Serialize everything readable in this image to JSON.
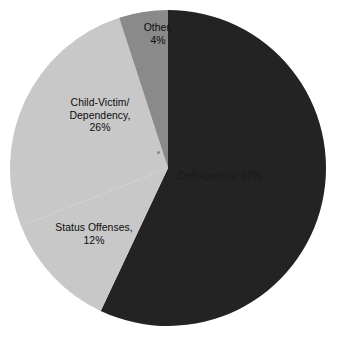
{
  "chart_data": {
    "type": "pie",
    "title": "",
    "categories": [
      "Delinquency",
      "Child-Victim/Dependency",
      "Status Offenses",
      "Other"
    ],
    "values": [
      57,
      26,
      12,
      4
    ],
    "unit": "%",
    "legend": "none",
    "labels_inline": true,
    "slices": [
      {
        "name": "Delinquency",
        "value": 57,
        "value_label": "57%",
        "label": "Delinquency, 57%",
        "color": "#232323",
        "text_color": "#191919",
        "start_angle_deg": 0,
        "end_angle_deg": 205.2
      },
      {
        "name": "Status Offenses",
        "value": 12,
        "value_label": "12%",
        "label": "Status Offenses,\n12%",
        "color": "#c8c8c8",
        "text_color": "#0d0d0d",
        "start_angle_deg": 205.2,
        "end_angle_deg": 248.4
      },
      {
        "name": "Child-Victim/Dependency",
        "value": 26,
        "value_label": "26%",
        "label": "Child-Victim/\nDependency,\n26%",
        "color": "#c8c8c8",
        "text_color": "#0d0d0d",
        "start_angle_deg": 248.4,
        "end_angle_deg": 342.0
      },
      {
        "name": "Other",
        "value": 4,
        "value_label": "4%",
        "label": "Other,\n4%",
        "color": "#8a8a8a",
        "text_color": "#0d0d0d",
        "start_angle_deg": 342.0,
        "end_angle_deg": 360
      }
    ],
    "geometry": {
      "center_x": 168,
      "center_y": 168,
      "radius": 158
    },
    "background_color": "#ffffff"
  }
}
